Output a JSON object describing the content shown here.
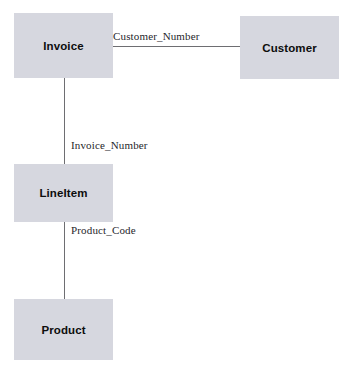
{
  "diagram": {
    "type": "entity-relationship-diagram",
    "background_color": "#ffffff",
    "entity_fill_color": "#d6d7df",
    "connector_color": "#6e6e72",
    "entity_text_color": "#0d0d0d",
    "relationship_text_color": "#26262b",
    "entities": [
      {
        "id": "invoice",
        "label": "Invoice"
      },
      {
        "id": "customer",
        "label": "Customer"
      },
      {
        "id": "lineitem",
        "label": "LineItem"
      },
      {
        "id": "product",
        "label": "Product"
      }
    ],
    "relationships": [
      {
        "id": "invoice-customer",
        "label": "Customer_Number",
        "from": "Invoice",
        "to": "Customer"
      },
      {
        "id": "invoice-lineitem",
        "label": "Invoice_Number",
        "from": "Invoice",
        "to": "LineItem"
      },
      {
        "id": "lineitem-product",
        "label": "Product_Code",
        "from": "LineItem",
        "to": "Product"
      }
    ]
  }
}
